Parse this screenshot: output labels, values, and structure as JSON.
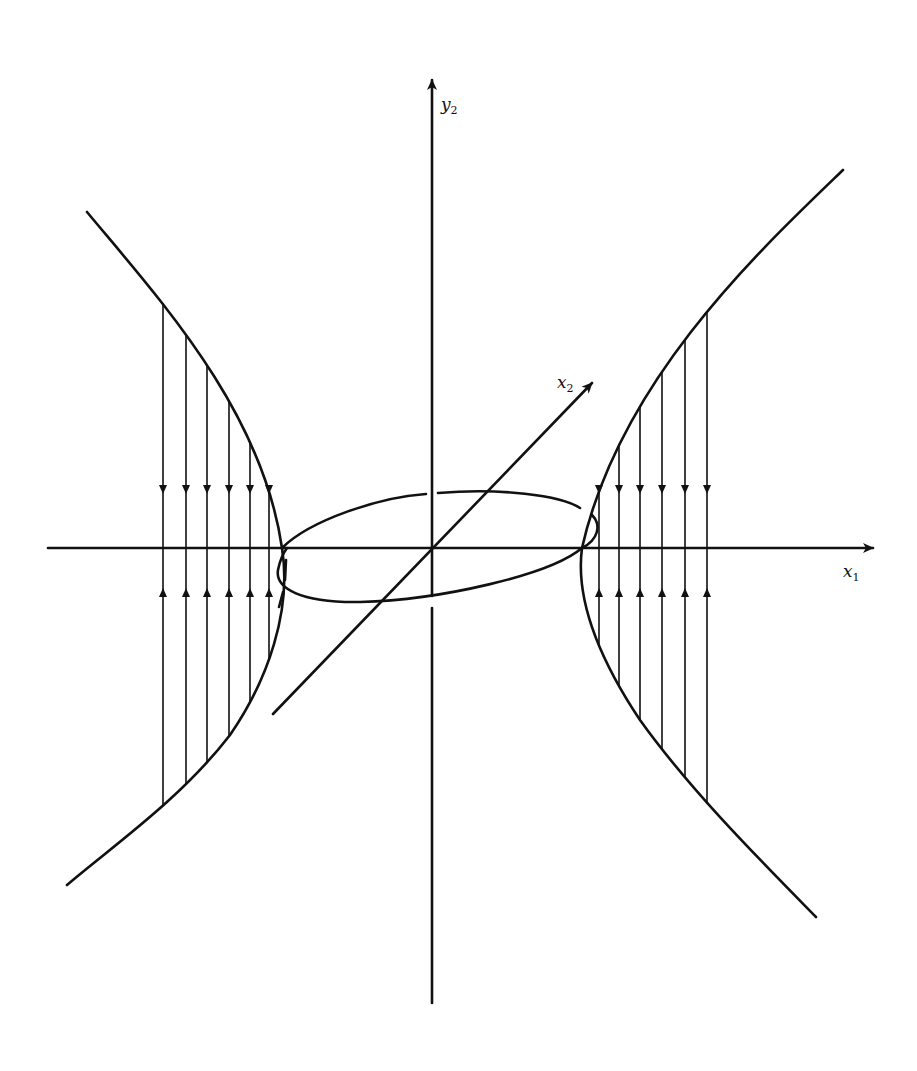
{
  "figure": {
    "type": "phase-portrait-sketch",
    "ink_color": "#111111",
    "background_color": "#ffffff"
  },
  "axes": {
    "x1": {
      "label_main": "x",
      "label_sub": "1",
      "from": [
        48,
        548
      ],
      "to": [
        875,
        548
      ]
    },
    "y2": {
      "label_main": "y",
      "label_sub": "2",
      "from": [
        432,
        1003
      ],
      "to": [
        432,
        78
      ]
    },
    "x2": {
      "label_main": "x",
      "label_sub": "2",
      "from": [
        273,
        714
      ],
      "to": [
        593,
        382
      ]
    }
  },
  "hyperbola": {
    "left": {
      "top": [
        87,
        212
      ],
      "vertex": [
        282,
        548
      ],
      "bottom": [
        67,
        885
      ]
    },
    "right": {
      "top": [
        843,
        170
      ],
      "vertex": [
        582,
        548
      ],
      "bottom": [
        816,
        917
      ]
    }
  },
  "flow_lines": {
    "left_x": [
      163,
      186,
      207,
      229,
      250,
      269
    ],
    "right_x": [
      599,
      619,
      640,
      662,
      685,
      707
    ],
    "down_arrow_y": 490,
    "up_arrow_y": 592,
    "direction_upper": "toward x1-axis (downward)",
    "direction_lower": "toward x1-axis (upward)"
  },
  "ellipse": {
    "center": [
      432,
      548
    ],
    "passes_through": [
      [
        282,
        548
      ],
      [
        582,
        548
      ]
    ],
    "note": "drawn with breaks where it passes behind the y2 axis and hyperbolas"
  }
}
